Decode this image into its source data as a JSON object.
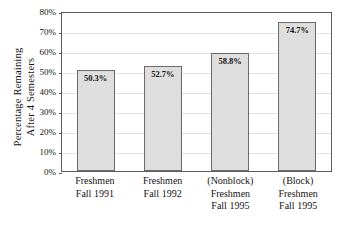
{
  "chart_data": {
    "type": "bar",
    "title": "",
    "xlabel": "",
    "ylabel_lines": [
      "Percentage Remaining",
      "After 4 Semesters"
    ],
    "ylabel": "Percentage Remaining After 4 Semesters",
    "ylim": [
      0,
      80
    ],
    "ytick_labels": [
      "0%",
      "10%",
      "20%",
      "30%",
      "40%",
      "50%",
      "60%",
      "70%",
      "80%"
    ],
    "ytick_values": [
      0,
      10,
      20,
      30,
      40,
      50,
      60,
      70,
      80
    ],
    "grid": true,
    "legend": "none",
    "categories": [
      "Freshmen Fall 1991",
      "Freshmen Fall 1992",
      "(Nonblock) Freshmen Fall 1995",
      "(Block) Freshmen Fall 1995"
    ],
    "category_lines": [
      [
        "Freshmen",
        "Fall 1991"
      ],
      [
        "Freshmen",
        "Fall 1992"
      ],
      [
        "(Nonblock)",
        "Freshmen",
        "Fall 1995"
      ],
      [
        "(Block)",
        "Freshmen",
        "Fall 1995"
      ]
    ],
    "values": [
      50.3,
      52.7,
      58.8,
      74.7
    ],
    "value_labels": [
      "50.3%",
      "52.7%",
      "58.8%",
      "74.7%"
    ],
    "bar_fill": "#dedede",
    "bar_stroke": "#6b6b6b",
    "axis_color": "#5d5d5d",
    "grid_color": "#e2e2e2"
  }
}
